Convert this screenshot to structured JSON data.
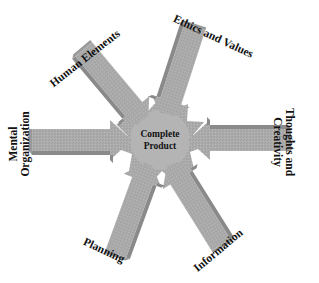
{
  "diagram": {
    "center": {
      "line1": "Complete",
      "line2": "Product"
    },
    "arrows": [
      {
        "label": "Human Elements"
      },
      {
        "label": "Ethics and Values"
      },
      {
        "label_line1": "Thoughts and",
        "label_line2": "Creativity"
      },
      {
        "label": "Information"
      },
      {
        "label": "Planning"
      },
      {
        "label_line1": "Mental",
        "label_line2": "Organization"
      }
    ],
    "colors": {
      "arrow_face": "#a9a9a9",
      "arrow_side": "#8c8c8c",
      "center_fill": "#b3b3b3",
      "text": "#111111"
    }
  }
}
